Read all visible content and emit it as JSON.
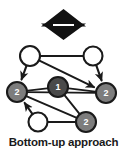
{
  "figure": {
    "caption": "Bottom-up approach",
    "top_icon": "double-vertical-arrow-icon",
    "colors": {
      "stroke": "#1a1a1a",
      "node_empty_fill": "#ffffff",
      "node_level1_fill": "#4a4a4a",
      "node_level2_fill": "#7d7d7d",
      "label_text": "#ffffff",
      "caption_text": "#1a1a1a",
      "background": "#ffffff"
    }
  },
  "diagram": {
    "type": "directed-graph",
    "nodes": [
      {
        "id": "n-top-left",
        "label": "",
        "state": "empty",
        "cx": 30,
        "cy": 56,
        "r": 10
      },
      {
        "id": "n-top-right",
        "label": "",
        "state": "empty",
        "cx": 93,
        "cy": 56,
        "r": 9.5
      },
      {
        "id": "n-left",
        "label": "2",
        "state": "filled",
        "cx": 17,
        "cy": 92,
        "r": 10
      },
      {
        "id": "n-center",
        "label": "1",
        "state": "filled",
        "cx": 58,
        "cy": 87,
        "r": 10
      },
      {
        "id": "n-right",
        "label": "2",
        "state": "filled",
        "cx": 106,
        "cy": 93,
        "r": 10
      },
      {
        "id": "n-bottom-left",
        "label": "",
        "state": "empty",
        "cx": 38,
        "cy": 122,
        "r": 9.5
      },
      {
        "id": "n-bottom-right",
        "label": "2",
        "state": "filled",
        "cx": 86,
        "cy": 122,
        "r": 10
      }
    ],
    "edges": [
      {
        "from": "n-top-left",
        "to": "n-top-right",
        "arrow": false
      },
      {
        "from": "n-top-left",
        "to": "n-left",
        "arrow": true
      },
      {
        "from": "n-top-left",
        "to": "n-right",
        "arrow": true
      },
      {
        "from": "n-top-right",
        "to": "n-right",
        "arrow": true
      },
      {
        "from": "n-center",
        "to": "n-left",
        "arrow": false
      },
      {
        "from": "n-center",
        "to": "n-right",
        "arrow": false
      },
      {
        "from": "n-center",
        "to": "n-bottom-right",
        "arrow": false
      },
      {
        "from": "n-left",
        "to": "n-bottom-right",
        "arrow": false
      },
      {
        "from": "n-left",
        "to": "n-right",
        "arrow": false
      },
      {
        "from": "n-bottom-left",
        "to": "n-left",
        "arrow": true
      },
      {
        "from": "n-bottom-left",
        "to": "n-bottom-right",
        "arrow": false
      }
    ]
  }
}
